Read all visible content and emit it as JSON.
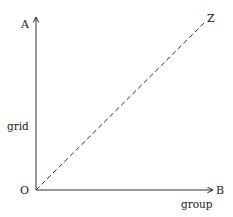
{
  "diagram": {
    "type": "axes-with-diagonal",
    "origin_label": "O",
    "vertical_axis": {
      "end_label": "A",
      "name_label": "grid"
    },
    "horizontal_axis": {
      "end_label": "B",
      "name_label": "group"
    },
    "diagonal": {
      "end_label": "Z",
      "style": "dashed"
    },
    "colors": {
      "line": "#222222",
      "text": "#222222",
      "background": "#ffffff"
    }
  }
}
